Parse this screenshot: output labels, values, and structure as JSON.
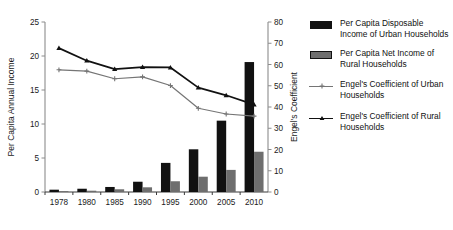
{
  "chart_data": {
    "type": "bar",
    "title": "",
    "subtitle": "",
    "xlabel": "",
    "ylabel": "Per Capita Annual Income",
    "y2label": "Engel's Coefficient",
    "categories": [
      "1978",
      "1980",
      "1985",
      "1990",
      "1995",
      "2000",
      "2005",
      "2010"
    ],
    "ylim": [
      0,
      25
    ],
    "yticks": [
      0,
      5,
      10,
      15,
      20,
      25
    ],
    "y2lim": [
      0,
      80
    ],
    "y2ticks": [
      0,
      10,
      20,
      30,
      40,
      50,
      60,
      70,
      80
    ],
    "grid": false,
    "legend_position": "right",
    "series": [
      {
        "name": "Per Capita Disposable Income of Urban Households",
        "short_name": "urban_income",
        "kind": "bar",
        "axis": "left",
        "color": "#111111",
        "values": [
          0.34,
          0.48,
          0.74,
          1.51,
          4.28,
          6.28,
          10.49,
          19.11
        ]
      },
      {
        "name": "Per Capita Net Income of Rural Households",
        "short_name": "rural_income",
        "kind": "bar",
        "axis": "left",
        "color": "#6e6e6e",
        "values": [
          0.13,
          0.19,
          0.4,
          0.69,
          1.58,
          2.25,
          3.25,
          5.92
        ]
      },
      {
        "name": "Engel's Coefficient of Urban Households",
        "short_name": "urban_engel",
        "kind": "line",
        "axis": "right",
        "color": "#757575",
        "marker": "plus",
        "values": [
          57.5,
          56.9,
          53.3,
          54.2,
          50.1,
          39.4,
          36.7,
          35.7
        ]
      },
      {
        "name": "Engel's Coefficient of Rural Households",
        "short_name": "rural_engel",
        "kind": "line",
        "axis": "right",
        "color": "#111111",
        "marker": "triangle",
        "values": [
          67.7,
          61.8,
          57.8,
          58.8,
          58.6,
          49.1,
          45.5,
          41.1
        ]
      }
    ]
  },
  "axes": {
    "left_title": "Per Capita Annual Income",
    "right_title": "Engel's Coefficient"
  },
  "legend": {
    "items": [
      {
        "key": "bar-black",
        "label": "Per Capita Disposable Income of Urban Households",
        "color": "#111111"
      },
      {
        "key": "bar-gray",
        "label": "Per Capita Net Income of Rural Households",
        "color": "#6e6e6e"
      },
      {
        "key": "line-gray-plus",
        "label": "Engel's Coefficient of Urban Households",
        "color": "#757575"
      },
      {
        "key": "line-black-triangle",
        "label": "Engel's Coefficient of Rural Households",
        "color": "#111111"
      }
    ]
  }
}
